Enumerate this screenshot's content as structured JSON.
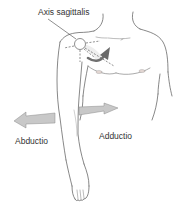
{
  "diagram": {
    "labels": {
      "axis": "Axis sagittalis",
      "abduction": "Abductio",
      "adduction": "Adductio"
    },
    "colors": {
      "outline": "#555555",
      "arrow_fill": "#c8c8c8",
      "arrow_stroke": "#8a8a8a",
      "rotation_arrow": "#707070",
      "axis_lines": "#444444",
      "text": "#333333",
      "skin_shading": "#e6e6e6"
    }
  }
}
